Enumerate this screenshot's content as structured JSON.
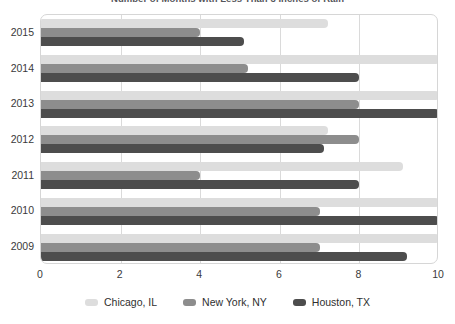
{
  "chart_data": {
    "type": "bar",
    "orientation": "horizontal",
    "title": "Number of Months with Less Than 3 Inches of Rain",
    "xlabel": "",
    "ylabel": "",
    "categories": [
      "2015",
      "2014",
      "2013",
      "2012",
      "2011",
      "2010",
      "2009"
    ],
    "series": [
      {
        "name": "Chicago, IL",
        "color": "#dddddd",
        "values": [
          7.2,
          10.0,
          10.0,
          7.2,
          9.1,
          10.0,
          10.0
        ]
      },
      {
        "name": "New York, NY",
        "color": "#8d8d8d",
        "values": [
          4.0,
          5.2,
          8.0,
          8.0,
          4.0,
          7.0,
          7.0
        ]
      },
      {
        "name": "Houston, TX",
        "color": "#4d4d4d",
        "values": [
          5.1,
          8.0,
          10.0,
          7.1,
          8.0,
          10.0,
          9.2
        ]
      }
    ],
    "xlim": [
      0,
      10
    ],
    "xticks": [
      0,
      2,
      4,
      6,
      8,
      10
    ],
    "xtick_labels": [
      "0",
      "2",
      "4",
      "6",
      "8",
      "10"
    ],
    "grid": true,
    "grid_axis": "x",
    "legend_position": "bottom"
  },
  "legend": {
    "items": [
      {
        "label": "Chicago, IL",
        "color": "#dddddd"
      },
      {
        "label": "New York, NY",
        "color": "#8d8d8d"
      },
      {
        "label": "Houston, TX",
        "color": "#4d4d4d"
      }
    ]
  }
}
